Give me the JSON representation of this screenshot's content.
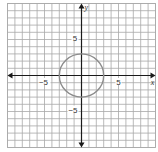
{
  "chart_data": {
    "type": "line",
    "title": "",
    "xlabel": "x",
    "ylabel": "y",
    "xlim": [
      -10,
      10
    ],
    "ylim": [
      -10,
      10
    ],
    "grid": true,
    "grid_step": 1,
    "tick_labels": {
      "x": [
        {
          "value": -5,
          "text": "−5"
        },
        {
          "value": 5,
          "text": "5"
        }
      ],
      "y": [
        {
          "value": 5,
          "text": "5"
        },
        {
          "value": -5,
          "text": "−5"
        }
      ]
    },
    "series": [
      {
        "name": "circle",
        "shape": "circle",
        "equation": "x^2 + y^2 = 9",
        "center": [
          0,
          0
        ],
        "radius": 3,
        "points": [
          [
            3,
            0
          ],
          [
            0,
            3
          ],
          [
            -3,
            0
          ],
          [
            0,
            -3
          ]
        ]
      }
    ],
    "legend": null
  },
  "style": {
    "curve_color": "#8c8c8c",
    "axis_color": "#1a1a1a",
    "grid_color": "#a8a8a8"
  },
  "labels": {
    "x_axis_name": "x",
    "y_axis_name": "y",
    "x_tick_neg": "−5",
    "x_tick_pos": "5",
    "y_tick_pos": "5",
    "y_tick_neg": "−5"
  }
}
